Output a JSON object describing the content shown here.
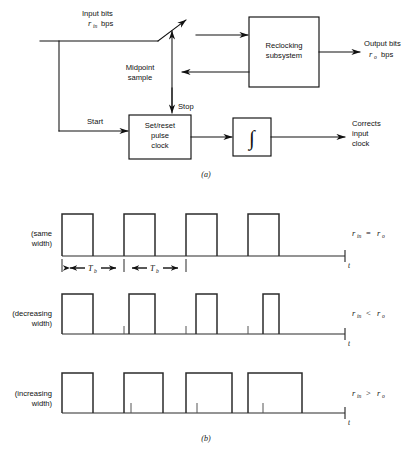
{
  "figure": {
    "caption_a": "(a)",
    "caption_b": "(b)"
  },
  "diagram_a": {
    "input_label_line1": "Input bits",
    "input_label_line2_var": "r",
    "input_label_line2_sub": "in",
    "input_label_line2_unit": "bps",
    "output_label_line1": "Output bits",
    "output_label_line2_var": "r",
    "output_label_line2_sub": "o",
    "output_label_line2_unit": "bps",
    "midpoint_label_line1": "Midpoint",
    "midpoint_label_line2": "sample",
    "stop_label": "Stop",
    "start_label": "Start",
    "corrects_label_line1": "Corrects",
    "corrects_label_line2": "input",
    "corrects_label_line3": "clock",
    "blocks": [
      {
        "name": "reclocking-subsystem",
        "line1": "Reclocking",
        "line2": "subsystem"
      },
      {
        "name": "set-reset-pulse-clock",
        "line1": "Set/reset",
        "line2": "pulse",
        "line3": "clock"
      },
      {
        "name": "integrator",
        "symbol": "∫"
      }
    ]
  },
  "diagram_b": {
    "time_axis_label": "t",
    "interval_label_var": "T",
    "interval_label_sub": "b",
    "intervals": [
      "T_b",
      "T_b"
    ],
    "rows": [
      {
        "name": "same-width",
        "label_line1": "(same",
        "label_line2": "width)",
        "relation_left_var": "r",
        "relation_left_sub": "in",
        "relation_op": "=",
        "relation_right_var": "r",
        "relation_right_sub": "o",
        "relation_text": "r_in = r_o",
        "pulse_widths_px": [
          31,
          31,
          31,
          31
        ],
        "pulse_starts_px": [
          62,
          124,
          186,
          248
        ],
        "has_dimension_arrows": true,
        "tick_positions_px": []
      },
      {
        "name": "decreasing-width",
        "label_line1": "(decreasing",
        "label_line2": "width)",
        "relation_left_var": "r",
        "relation_left_sub": "in",
        "relation_op": "<",
        "relation_right_var": "r",
        "relation_right_sub": "o",
        "relation_text": "r_in < r_o",
        "pulse_widths_px": [
          31,
          26,
          21,
          16
        ],
        "pulse_starts_px": [
          62,
          129,
          196,
          263
        ],
        "has_dimension_arrows": false,
        "tick_positions_px": [
          124,
          186,
          248
        ]
      },
      {
        "name": "increasing-width",
        "label_line1": "(increasing",
        "label_line2": "width)",
        "relation_left_var": "r",
        "relation_left_sub": "in",
        "relation_op": ">",
        "relation_right_var": "r",
        "relation_right_sub": "o",
        "relation_text": "r_in > r_o",
        "pulse_widths_px": [
          31,
          39,
          46,
          54
        ],
        "pulse_starts_px": [
          62,
          124,
          186,
          248
        ],
        "has_dimension_arrows": false,
        "tick_positions_px": [
          131,
          197,
          263
        ]
      }
    ]
  },
  "colors": {
    "ink": "#111111",
    "wave_ink": "#2b2b2b",
    "tick_ink": "#555555",
    "background": "#ffffff"
  }
}
